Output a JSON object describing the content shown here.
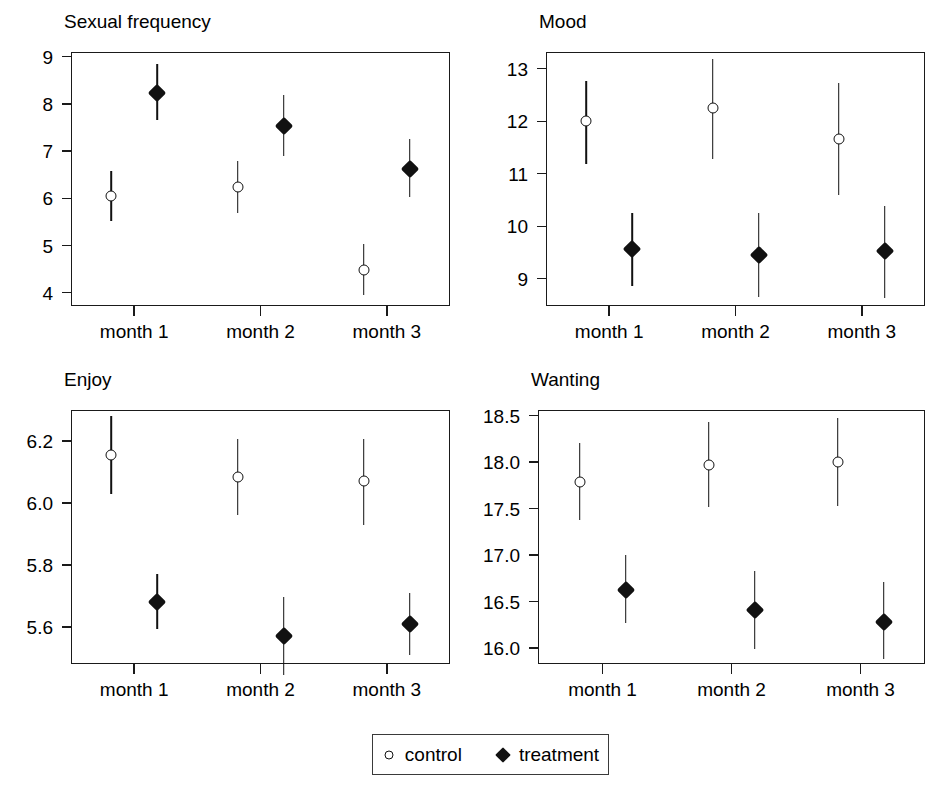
{
  "figure": {
    "width": 949,
    "height": 809,
    "background": "#ffffff",
    "foreground": "#111111"
  },
  "legend": {
    "entries": [
      {
        "label": "control",
        "symbol": "open-circle-icon"
      },
      {
        "label": "treatment",
        "symbol": "filled-diamond-icon"
      }
    ]
  },
  "chart_data": [
    {
      "type": "scatter",
      "title": "Sexual frequency",
      "xlabel": "",
      "ylabel": "",
      "categories": [
        "month 1",
        "month 2",
        "month 3"
      ],
      "yticks": [
        "9",
        "8",
        "7",
        "6",
        "5",
        "4"
      ],
      "ytickvalues": [
        9,
        8,
        7,
        6,
        5,
        4
      ],
      "ylim": [
        3.72,
        9.1
      ],
      "grid": false,
      "legend_position": "bottom",
      "series": [
        {
          "name": "control",
          "marker": "open-circle",
          "values": [
            6.05,
            6.23,
            4.48
          ],
          "err_low": [
            5.51,
            5.69,
            3.95
          ],
          "err_high": [
            6.57,
            6.79,
            5.04
          ]
        },
        {
          "name": "treatment",
          "marker": "filled-diamond",
          "values": [
            8.24,
            7.54,
            6.63
          ],
          "err_low": [
            7.66,
            6.89,
            6.03
          ],
          "err_high": [
            8.84,
            8.18,
            7.25
          ]
        }
      ]
    },
    {
      "type": "scatter",
      "title": "Mood",
      "xlabel": "",
      "ylabel": "",
      "categories": [
        "month 1",
        "month 2",
        "month 3"
      ],
      "yticks": [
        "13",
        "12",
        "11",
        "10",
        "9"
      ],
      "ytickvalues": [
        13,
        12,
        11,
        10,
        9
      ],
      "ylim": [
        8.48,
        13.32
      ],
      "grid": false,
      "legend_position": "bottom",
      "series": [
        {
          "name": "control",
          "marker": "open-circle",
          "values": [
            12.0,
            12.25,
            11.66
          ],
          "err_low": [
            11.19,
            11.29,
            10.6
          ],
          "err_high": [
            12.76,
            13.18,
            12.72
          ]
        },
        {
          "name": "treatment",
          "marker": "filled-diamond",
          "values": [
            9.56,
            9.46,
            9.52
          ],
          "err_low": [
            8.87,
            8.65,
            8.63
          ],
          "err_high": [
            10.25,
            10.26,
            10.39
          ]
        }
      ]
    },
    {
      "type": "scatter",
      "title": "Enjoy",
      "xlabel": "",
      "ylabel": "",
      "categories": [
        "month 1",
        "month 2",
        "month 3"
      ],
      "yticks": [
        "6.2",
        "6.0",
        "5.8",
        "5.6"
      ],
      "ytickvalues": [
        6.2,
        6.0,
        5.8,
        5.6
      ],
      "ylim": [
        5.48,
        6.3
      ],
      "grid": false,
      "legend_position": "bottom",
      "series": [
        {
          "name": "control",
          "marker": "open-circle",
          "values": [
            6.155,
            6.085,
            6.072
          ],
          "err_low": [
            6.03,
            5.962,
            5.929
          ],
          "err_high": [
            6.281,
            6.205,
            6.206
          ]
        },
        {
          "name": "treatment",
          "marker": "filled-diamond",
          "values": [
            5.681,
            5.57,
            5.609
          ],
          "err_low": [
            5.592,
            5.446,
            5.508
          ],
          "err_high": [
            5.772,
            5.695,
            5.71
          ]
        }
      ]
    },
    {
      "type": "scatter",
      "title": "Wanting",
      "xlabel": "",
      "ylabel": "",
      "categories": [
        "month 1",
        "month 2",
        "month 3"
      ],
      "yticks": [
        "18.5",
        "18.0",
        "17.5",
        "17.0",
        "16.5",
        "16.0"
      ],
      "ytickvalues": [
        18.5,
        18.0,
        17.5,
        17.0,
        16.5,
        16.0
      ],
      "ylim": [
        15.83,
        18.56
      ],
      "grid": false,
      "legend_position": "bottom",
      "series": [
        {
          "name": "control",
          "marker": "open-circle",
          "values": [
            17.79,
            17.97,
            18.0
          ],
          "err_low": [
            17.38,
            17.52,
            17.53
          ],
          "err_high": [
            18.2,
            18.43,
            18.47
          ]
        },
        {
          "name": "treatment",
          "marker": "filled-diamond",
          "values": [
            16.63,
            16.41,
            16.28
          ],
          "err_low": [
            16.27,
            15.99,
            15.88
          ],
          "err_high": [
            17.0,
            16.83,
            16.71
          ]
        }
      ]
    }
  ]
}
